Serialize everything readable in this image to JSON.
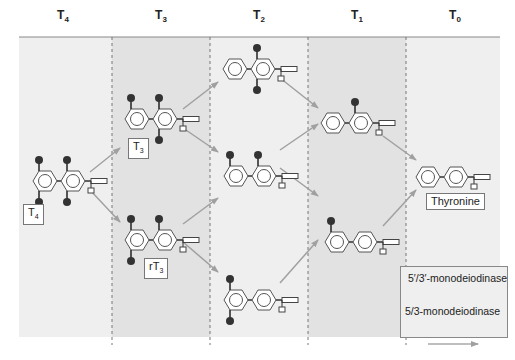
{
  "diagram": {
    "columns": [
      {
        "id": "T4",
        "label": "T",
        "sub": "4"
      },
      {
        "id": "T3",
        "label": "T",
        "sub": "3"
      },
      {
        "id": "T2",
        "label": "T",
        "sub": "2"
      },
      {
        "id": "T1",
        "label": "T",
        "sub": "1"
      },
      {
        "id": "T0",
        "label": "T",
        "sub": "0"
      }
    ],
    "molecules": [
      {
        "id": "T4",
        "label_main": "T",
        "label_sub": "4",
        "iodines": "3,5,3',5'"
      },
      {
        "id": "T3",
        "label_main": "T",
        "label_sub": "3",
        "iodines": "3,5,3'"
      },
      {
        "id": "rT3",
        "label_main": "rT",
        "label_sub": "3",
        "iodines": "3,3',5'"
      },
      {
        "id": "T2_top",
        "iodines": "3,5"
      },
      {
        "id": "T2_mid",
        "iodines": "3,3'"
      },
      {
        "id": "T2_bot",
        "iodines": "3',5'"
      },
      {
        "id": "T1_top",
        "iodines": "3"
      },
      {
        "id": "T1_bot",
        "iodines": "3'"
      },
      {
        "id": "T0",
        "label_main": "Thyronine",
        "iodines": "none"
      }
    ],
    "legend": {
      "items": [
        {
          "label": "5′/3′-monodeiodinase",
          "color": "#9a9a9a"
        },
        {
          "label": "5/3-monodeiodinase",
          "color": "#a8a8a8"
        }
      ]
    },
    "colors": {
      "panel_light": "#efefef",
      "panel_dark": "#e2e2e2",
      "arrow": "#a0a0a0",
      "iodine": "#333333",
      "ring": "#666666"
    }
  }
}
